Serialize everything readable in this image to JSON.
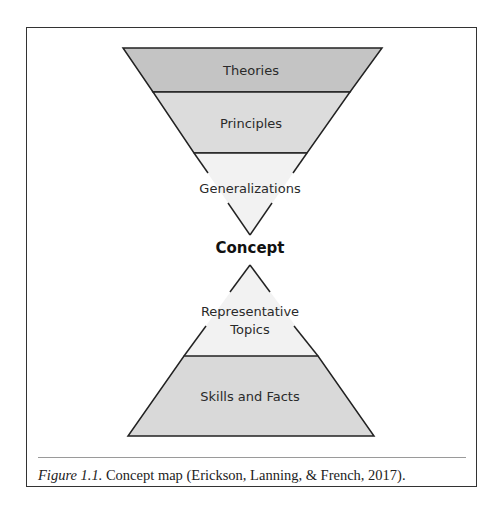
{
  "diagram": {
    "type": "concept-map-hourglass",
    "top_funnel": {
      "levels": [
        {
          "label": "Theories",
          "fill": "#c4c4c4"
        },
        {
          "label": "Principles",
          "fill": "#dcdcdc"
        },
        {
          "label": "Generalizations",
          "fill": "#f2f2f2"
        }
      ]
    },
    "center": {
      "label": "Concept"
    },
    "bottom_pyramid": {
      "levels": [
        {
          "label_line1": "Representative",
          "label_line2": "Topics",
          "fill": "#f2f2f2"
        },
        {
          "label": "Skills and Facts",
          "fill": "#d9d9d9"
        }
      ]
    },
    "stroke_color": "#222222"
  },
  "caption": {
    "figure_label": "Figure 1.1.",
    "text": " Concept map (Erickson, Lanning, & French, 2017)."
  }
}
